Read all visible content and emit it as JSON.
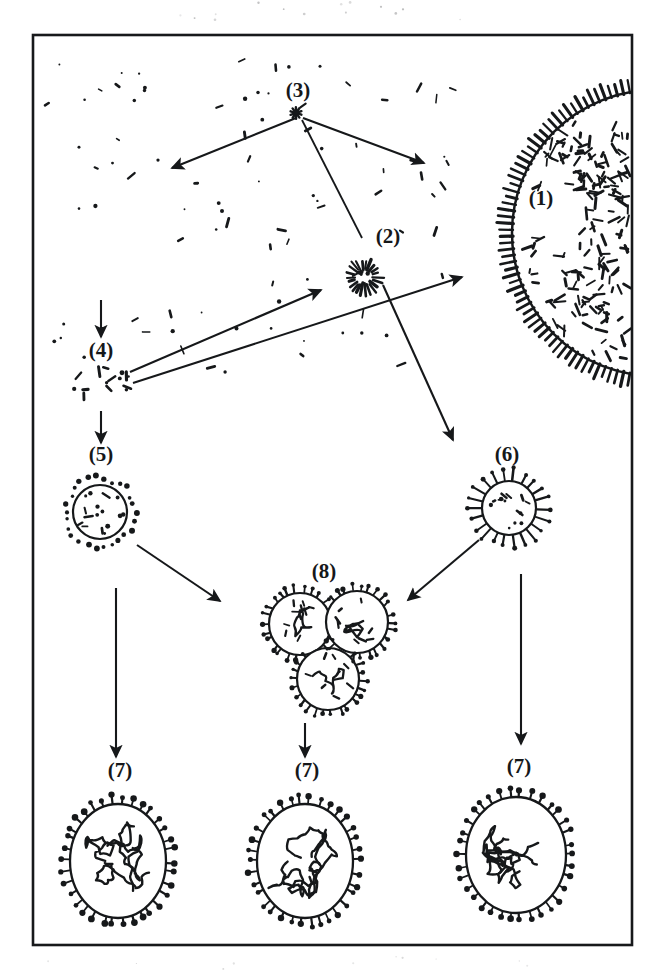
{
  "figure": {
    "type": "diagram",
    "background_color": "#ffffff",
    "ink_color": "#16181a",
    "frame": {
      "x": 33,
      "y": 35,
      "width": 599,
      "height": 910,
      "stroke_width": 2.6,
      "name": "figure-border"
    }
  },
  "labels": [
    {
      "id": "l1",
      "text": "(1)",
      "x": 541,
      "y": 205,
      "target": "host-cell"
    },
    {
      "id": "l2",
      "text": "(2)",
      "x": 388,
      "y": 243,
      "target": "starburst-particle"
    },
    {
      "id": "l3",
      "text": "(3)",
      "x": 298,
      "y": 97,
      "target": "asterisk-source"
    },
    {
      "id": "l4",
      "text": "(4)",
      "x": 101,
      "y": 357,
      "target": "fragment-cluster"
    },
    {
      "id": "l5",
      "text": "(5)",
      "x": 101,
      "y": 461,
      "target": "enveloped-particle-left"
    },
    {
      "id": "l6",
      "text": "(6)",
      "x": 507,
      "y": 461,
      "target": "enveloped-particle-right"
    },
    {
      "id": "l7a",
      "text": "(7)",
      "x": 120,
      "y": 777,
      "target": "mature-virion-left"
    },
    {
      "id": "l7b",
      "text": "(7)",
      "x": 307,
      "y": 777,
      "target": "mature-virion-middle"
    },
    {
      "id": "l7c",
      "text": "(7)",
      "x": 519,
      "y": 773,
      "target": "mature-virion-right"
    },
    {
      "id": "l8",
      "text": "(8)",
      "x": 324,
      "y": 578,
      "target": "virion-cluster"
    }
  ],
  "shapes": {
    "host_cell": {
      "name": "host-cell",
      "cx": 655,
      "cy": 233,
      "r": 143,
      "cilia_count": 72,
      "cilia_length": 13,
      "interior_dash_count": 300,
      "description": "large ciliated cell, left hemisphere visible at right edge"
    },
    "starburst_particle": {
      "name": "starburst-particle",
      "cx": 364,
      "cy": 277,
      "r": 18,
      "ray_count": 22,
      "description": "small radial burst of dashes"
    },
    "asterisk_source": {
      "name": "asterisk-source",
      "cx": 296,
      "cy": 113,
      "r": 6,
      "description": "small asterisk marking origin point"
    },
    "fragment_cluster": {
      "name": "fragment-cluster",
      "cx": 100,
      "cy": 385,
      "rx": 30,
      "ry": 20,
      "fragment_count": 14,
      "description": "loose scatter of nucleocapsid fragments"
    },
    "enveloped_particle_left": {
      "name": "enveloped-particle-left",
      "cx": 100,
      "cy": 512,
      "r": 27,
      "spike_count": 26,
      "spike_style": "short-dot",
      "description": "budding enveloped particle"
    },
    "enveloped_particle_right": {
      "name": "enveloped-particle-right",
      "cx": 509,
      "cy": 508,
      "r": 27,
      "spike_count": 22,
      "spike_style": "long-knob",
      "description": "budding enveloped particle with long knobbed spikes"
    },
    "virion_cluster": {
      "name": "virion-cluster",
      "members": [
        {
          "cx": 300,
          "cy": 624,
          "r": 31
        },
        {
          "cx": 357,
          "cy": 622,
          "r": 31
        },
        {
          "cx": 328,
          "cy": 679,
          "r": 31
        }
      ],
      "spike_count": 26,
      "description": "triad of aggregated spiked virions"
    },
    "mature_virions": [
      {
        "name": "mature-virion-left",
        "cx": 118,
        "cy": 861,
        "rx": 48,
        "ry": 57,
        "spike_count": 34
      },
      {
        "name": "mature-virion-middle",
        "cx": 305,
        "cy": 861,
        "rx": 48,
        "ry": 57,
        "spike_count": 34
      },
      {
        "name": "mature-virion-right",
        "cx": 516,
        "cy": 855,
        "rx": 50,
        "ry": 58,
        "spike_count": 34
      }
    ],
    "background_debris": {
      "name": "background-debris",
      "count": 95,
      "region": {
        "x": 45,
        "y": 60,
        "width": 430,
        "height": 320
      },
      "description": "scattered free nucleocapsid specks in extracellular space"
    }
  },
  "arrows": [
    {
      "id": "a1",
      "name": "arrow-source-to-left",
      "x1": 296,
      "y1": 118,
      "x2": 172,
      "y2": 168,
      "head": true
    },
    {
      "id": "a2",
      "name": "arrow-source-to-right",
      "x1": 303,
      "y1": 118,
      "x2": 424,
      "y2": 163,
      "head": true
    },
    {
      "id": "a3",
      "name": "leader-source-to-starburst",
      "x1": 302,
      "y1": 120,
      "x2": 362,
      "y2": 238,
      "head": false
    },
    {
      "id": "a4",
      "name": "arrow-debris-to-fragments",
      "x1": 101,
      "y1": 300,
      "x2": 101,
      "y2": 337,
      "head": true
    },
    {
      "id": "a5",
      "name": "arrow-fragments-to-starburst",
      "x1": 130,
      "y1": 372,
      "x2": 321,
      "y2": 290,
      "head": true
    },
    {
      "id": "a6",
      "name": "arrow-fragments-to-cell",
      "x1": 133,
      "y1": 383,
      "x2": 462,
      "y2": 277,
      "head": true
    },
    {
      "id": "a7",
      "name": "arrow-cell-to-right-particle",
      "x1": 383,
      "y1": 285,
      "x2": 453,
      "y2": 440,
      "head": true
    },
    {
      "id": "a8",
      "name": "arrow-fragments-to-left-particle",
      "x1": 101,
      "y1": 411,
      "x2": 101,
      "y2": 443,
      "head": true
    },
    {
      "id": "a9",
      "name": "arrow-left-particle-to-cluster",
      "x1": 137,
      "y1": 545,
      "x2": 220,
      "y2": 601,
      "head": true
    },
    {
      "id": "a10",
      "name": "arrow-right-particle-to-cluster",
      "x1": 479,
      "y1": 540,
      "x2": 408,
      "y2": 600,
      "head": true
    },
    {
      "id": "a11",
      "name": "arrow-left-particle-to-virion",
      "x1": 116,
      "y1": 588,
      "x2": 116,
      "y2": 757,
      "head": true
    },
    {
      "id": "a12",
      "name": "arrow-cluster-to-virion",
      "x1": 305,
      "y1": 723,
      "x2": 305,
      "y2": 757,
      "head": true
    },
    {
      "id": "a13",
      "name": "arrow-right-particle-to-virion",
      "x1": 521,
      "y1": 574,
      "x2": 521,
      "y2": 744,
      "head": true
    }
  ]
}
